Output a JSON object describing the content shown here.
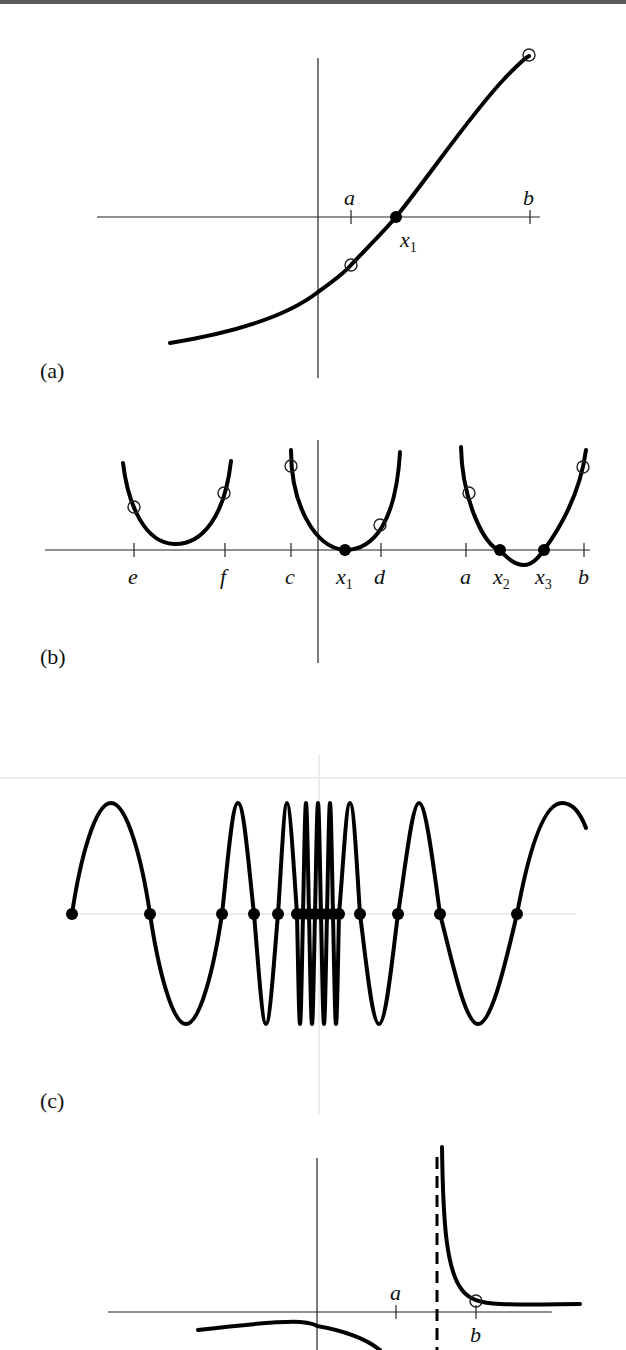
{
  "figure": {
    "panels": [
      {
        "id": "a",
        "label": "(a)",
        "description": "Increasing function crossing the x-axis once between a and b",
        "ticks": [
          {
            "name": "a",
            "x": 351
          },
          {
            "name": "b",
            "x": 530
          }
        ],
        "roots": [
          {
            "name": "x",
            "sub": "1",
            "x": 396
          }
        ],
        "hollow_points": [
          [
            351,
            265
          ],
          [
            529,
            55
          ]
        ]
      },
      {
        "id": "b",
        "label": "(b)",
        "description": "Three parabolas: no root on [e,f], double root on [c,d], two roots on [a,b]",
        "ticks": [
          {
            "name": "e",
            "x": 134
          },
          {
            "name": "f",
            "x": 225
          },
          {
            "name": "c",
            "x": 291
          },
          {
            "name": "d",
            "x": 381
          },
          {
            "name": "a",
            "x": 466
          },
          {
            "name": "b",
            "x": 584
          }
        ],
        "roots": [
          {
            "name": "x",
            "sub": "1",
            "x": 345
          },
          {
            "name": "x",
            "sub": "2",
            "x": 500
          },
          {
            "name": "x",
            "sub": "3",
            "x": 544
          }
        ]
      },
      {
        "id": "c",
        "label": "(c)",
        "description": "Oscillating function with roots accumulating toward the center",
        "root_x": [
          72,
          150,
          222,
          254,
          278,
          297,
          303,
          309,
          315,
          321,
          327,
          333,
          339,
          360,
          398,
          440,
          517
        ]
      },
      {
        "id": "d",
        "label": "(d)",
        "description": "Function with a vertical asymptote between a and b; sign change without a root",
        "ticks": [
          {
            "name": "a",
            "x": 396
          },
          {
            "name": "b",
            "x": 476
          }
        ],
        "asymptote_x": 437,
        "hollow_points": [
          [
            476,
            1301
          ]
        ]
      }
    ]
  },
  "labels": {
    "a_panel": "(a)",
    "b_panel": "(b)",
    "c_panel": "(c)",
    "a_tick_a": "a",
    "a_tick_b": "b",
    "a_root_x": "x",
    "a_root_sub": "1",
    "b_tick_e": "e",
    "b_tick_f": "f",
    "b_tick_c": "c",
    "b_tick_d": "d",
    "b_tick_a": "a",
    "b_tick_b": "b",
    "b_root1_x": "x",
    "b_root1_sub": "1",
    "b_root2_x": "x",
    "b_root2_sub": "2",
    "b_root3_x": "x",
    "b_root3_sub": "3",
    "d_tick_a": "a",
    "d_tick_b": "b"
  },
  "colors": {
    "ink": "#000000",
    "axis": "#222222",
    "faint_axis": "#d9d9d9",
    "background": "#ffffff"
  }
}
